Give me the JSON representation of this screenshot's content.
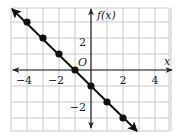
{
  "chart_data": {
    "type": "line",
    "title": "",
    "xlabel": "x",
    "ylabel": "f(x)",
    "origin_label": "O",
    "xlim": [
      -5,
      5
    ],
    "ylim": [
      -3.8,
      3.9
    ],
    "grid": true,
    "x_ticks": [
      {
        "value": -4,
        "label": "−4"
      },
      {
        "value": -2,
        "label": "−2"
      },
      {
        "value": 2,
        "label": "2"
      },
      {
        "value": 4,
        "label": "4"
      }
    ],
    "y_ticks": [
      {
        "value": 2,
        "label": "2"
      },
      {
        "value": -2,
        "label": "−2"
      }
    ],
    "series": [
      {
        "name": "f(x)",
        "equation": "f(x) = -x - 1",
        "x": [
          -4,
          -3,
          -2,
          -1,
          0,
          1,
          2
        ],
        "y": [
          3,
          2,
          1,
          0,
          -1,
          -2,
          -3
        ],
        "arrows_both_ends": true,
        "color": "#111111"
      }
    ],
    "legend": null
  },
  "colors": {
    "grid": "#c8c8c8",
    "axis": "#222222",
    "line": "#111111",
    "point": "#111111"
  }
}
